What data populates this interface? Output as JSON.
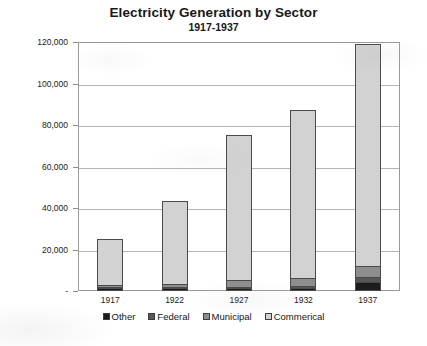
{
  "chart_data": {
    "type": "bar",
    "subtype": "stacked-column",
    "title": "Electricity Generation by Sector",
    "subtitle": "1917-1937",
    "xlabel": "",
    "ylabel": "Millions of kWh",
    "categories": [
      "1917",
      "1922",
      "1927",
      "1932",
      "1937"
    ],
    "series": [
      {
        "name": "Other",
        "color": "#1c1c1c",
        "values": [
          300,
          400,
          600,
          700,
          3400
        ]
      },
      {
        "name": "Federal",
        "color": "#575757",
        "values": [
          200,
          300,
          500,
          600,
          2600
        ]
      },
      {
        "name": "Municipal",
        "color": "#8e8e8e",
        "values": [
          1200,
          1700,
          3300,
          4100,
          5400
        ]
      },
      {
        "name": "Commerical",
        "color": "#d2d2d2",
        "values": [
          23300,
          41100,
          70600,
          81600,
          107600
        ]
      }
    ],
    "totals": [
      25000,
      43500,
      75000,
      87000,
      119000
    ],
    "ylim": [
      0,
      120000
    ],
    "yticks": [
      0,
      20000,
      40000,
      60000,
      80000,
      100000,
      120000
    ],
    "ytick_labels": [
      "-",
      "20,000",
      "40,000",
      "60,000",
      "80,000",
      "100,000",
      "120,000"
    ],
    "grid": true,
    "legend_position": "bottom",
    "plot_border_color": "#9a9a9a",
    "gridline_color": "#b4b4b4"
  }
}
